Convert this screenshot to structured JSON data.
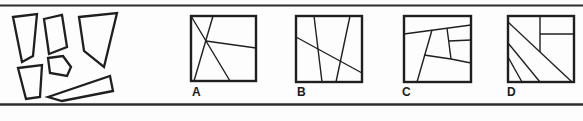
{
  "canvas": {
    "width": 583,
    "height": 121
  },
  "colors": {
    "background": "#fdfdfd",
    "stroke": "#1f1f1f",
    "rule": "#2e2e2e",
    "label": "#1b1b1b"
  },
  "rules": {
    "top": {
      "y": 5.5,
      "x1": 0,
      "x2": 583,
      "thickness": 1.8
    },
    "bottom": {
      "y": 104.5,
      "x1": 0,
      "x2": 583,
      "thickness": 2.6
    }
  },
  "puzzle_pieces": {
    "stroke_width": 2.3,
    "fill": "#fdfdfd",
    "polygons": [
      {
        "name": "piece-tall-left",
        "points": [
          [
            13,
            17
          ],
          [
            37,
            14
          ],
          [
            33,
            56
          ],
          [
            22,
            62
          ]
        ]
      },
      {
        "name": "piece-top-middle",
        "points": [
          [
            44,
            19
          ],
          [
            62,
            15
          ],
          [
            67,
            47
          ],
          [
            49,
            54
          ]
        ]
      },
      {
        "name": "piece-big-right",
        "points": [
          [
            79,
            17
          ],
          [
            117,
            13
          ],
          [
            104,
            67
          ],
          [
            84,
            51
          ]
        ]
      },
      {
        "name": "piece-center-small",
        "points": [
          [
            48,
            58
          ],
          [
            63,
            56
          ],
          [
            71,
            67
          ],
          [
            67,
            76
          ],
          [
            50,
            73
          ]
        ]
      },
      {
        "name": "piece-bottom-left",
        "points": [
          [
            18,
            68
          ],
          [
            42,
            65
          ],
          [
            40,
            97
          ],
          [
            26,
            99
          ]
        ]
      },
      {
        "name": "piece-bottom-wedge",
        "points": [
          [
            48,
            97
          ],
          [
            110,
            76
          ],
          [
            113,
            91
          ],
          [
            62,
            101
          ]
        ]
      }
    ]
  },
  "options": [
    {
      "label": "A",
      "box": {
        "x": 191,
        "y": 16,
        "w": 65,
        "h": 65
      },
      "border_width": 2.4,
      "line_width": 1.4,
      "cut_lines": [
        [
          191,
          16,
          230,
          81
        ],
        [
          213,
          16,
          194,
          81
        ],
        [
          206,
          41,
          256,
          48
        ]
      ],
      "label_pos": {
        "x": 192,
        "y": 86
      }
    },
    {
      "label": "B",
      "box": {
        "x": 296,
        "y": 16,
        "w": 66,
        "h": 66
      },
      "border_width": 2.4,
      "line_width": 1.4,
      "cut_lines": [
        [
          314,
          16,
          322,
          82
        ],
        [
          350,
          16,
          336,
          82
        ],
        [
          296,
          37,
          362,
          73
        ]
      ],
      "label_pos": {
        "x": 297,
        "y": 86
      }
    },
    {
      "label": "C",
      "box": {
        "x": 404,
        "y": 16,
        "w": 67,
        "h": 66
      },
      "border_width": 2.4,
      "line_width": 1.4,
      "cut_lines": [
        [
          404,
          34,
          471,
          25
        ],
        [
          432,
          30,
          417,
          82
        ],
        [
          447,
          28,
          451,
          59
        ],
        [
          449,
          41,
          471,
          40
        ],
        [
          424,
          55,
          451,
          59
        ],
        [
          451,
          59,
          471,
          63
        ]
      ],
      "label_pos": {
        "x": 402,
        "y": 86
      }
    },
    {
      "label": "D",
      "box": {
        "x": 508,
        "y": 16,
        "w": 66,
        "h": 66
      },
      "border_width": 2.4,
      "line_width": 1.4,
      "cut_lines": [
        [
          540,
          16,
          540,
          52
        ],
        [
          540,
          34,
          574,
          34
        ],
        [
          508,
          22,
          572,
          82
        ],
        [
          508,
          43,
          540,
          82
        ],
        [
          508,
          57,
          522,
          82
        ]
      ],
      "label_pos": {
        "x": 507,
        "y": 86
      }
    }
  ]
}
